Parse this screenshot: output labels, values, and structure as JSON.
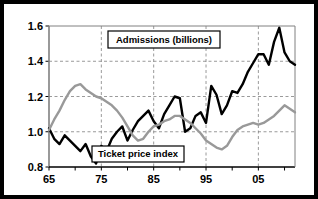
{
  "chart_data": {
    "type": "line",
    "title": "",
    "subtitle": "",
    "xlabel": "",
    "ylabel": "",
    "xlim": [
      1965,
      2012
    ],
    "ylim": [
      0.8,
      1.6
    ],
    "ytick_labels": [
      "1.6",
      "1.4",
      "1.2",
      "1.0",
      "0.8"
    ],
    "ytick_values": [
      1.6,
      1.4,
      1.2,
      1.0,
      0.8
    ],
    "xtick_labels": [
      "65",
      "75",
      "85",
      "95",
      "05"
    ],
    "xtick_values": [
      1965,
      1975,
      1985,
      1995,
      2005
    ],
    "minor_xtick_step": 5,
    "grid": "dashed horizontal and vertical gridlines at major ticks",
    "legend_position": "inline annotation boxes on plot",
    "x": [
      1965,
      1966,
      1967,
      1968,
      1969,
      1970,
      1971,
      1972,
      1973,
      1974,
      1975,
      1976,
      1977,
      1978,
      1979,
      1980,
      1981,
      1982,
      1983,
      1984,
      1985,
      1986,
      1987,
      1988,
      1989,
      1990,
      1991,
      1992,
      1993,
      1994,
      1995,
      1996,
      1997,
      1998,
      1999,
      2000,
      2001,
      2002,
      2003,
      2004,
      2005,
      2006,
      2007,
      2008,
      2009,
      2010,
      2011,
      2012
    ],
    "series": [
      {
        "name": "Admissions (billions)",
        "color": "#000000",
        "linewidth": 2.4,
        "values": [
          1.02,
          0.96,
          0.93,
          0.98,
          0.95,
          0.92,
          0.89,
          0.93,
          0.86,
          0.82,
          0.92,
          0.89,
          0.96,
          1.0,
          1.03,
          0.95,
          1.01,
          1.06,
          1.09,
          1.12,
          1.06,
          1.02,
          1.1,
          1.15,
          1.2,
          1.19,
          1.0,
          1.02,
          1.09,
          1.11,
          1.05,
          1.26,
          1.21,
          1.1,
          1.15,
          1.23,
          1.22,
          1.27,
          1.34,
          1.39,
          1.44,
          1.44,
          1.38,
          1.51,
          1.59,
          1.45,
          1.4,
          1.38
        ]
      },
      {
        "name": "Ticket price index",
        "color": "#999999",
        "linewidth": 2.4,
        "values": [
          1.01,
          1.07,
          1.12,
          1.18,
          1.23,
          1.26,
          1.27,
          1.24,
          1.22,
          1.2,
          1.19,
          1.17,
          1.15,
          1.12,
          1.08,
          1.03,
          0.98,
          0.95,
          0.96,
          1.0,
          1.03,
          1.04,
          1.06,
          1.07,
          1.09,
          1.09,
          1.07,
          1.05,
          1.02,
          0.99,
          0.95,
          0.93,
          0.91,
          0.9,
          0.92,
          0.97,
          1.01,
          1.03,
          1.04,
          1.05,
          1.04,
          1.05,
          1.07,
          1.09,
          1.12,
          1.15,
          1.13,
          1.11
        ]
      }
    ],
    "annotations": [
      {
        "name": "admissions-legend",
        "text": "Admissions (billions)"
      },
      {
        "name": "ticket-price-legend",
        "text": "Ticket price index"
      }
    ]
  },
  "plot": {
    "left": 45,
    "top": 22,
    "right": 291,
    "bottom": 163
  },
  "colors": {
    "frame": "#000000",
    "axis": "#808080",
    "grid": "#808080",
    "admissions": "#000000",
    "ticket_price": "#999999",
    "background": "#ffffff"
  }
}
